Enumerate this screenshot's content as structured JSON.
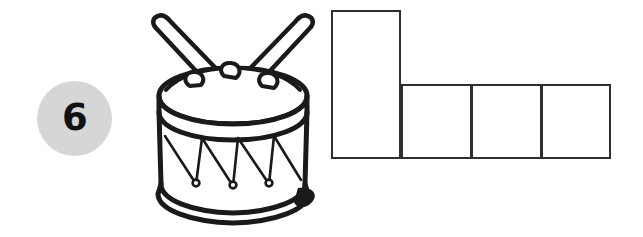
{
  "page": {
    "background_color": "#ffffff",
    "width": 643,
    "height": 237
  },
  "item": {
    "number": "6",
    "badge_fill": "#d6d6d6",
    "badge_text_color": "#111111"
  },
  "illustration": {
    "name": "drum-with-drumsticks",
    "alt_text": "Line drawing of a marching drum with two crossed drumsticks",
    "line_color": "#1a1a1a",
    "fill_color": "#ffffff",
    "parts": [
      "left-drumstick",
      "right-drumstick",
      "drum-head",
      "top-rim",
      "drum-shell",
      "tension-cords",
      "bottom-rim",
      "shadow"
    ]
  },
  "answer_grid": {
    "name": "l-shaped-answer-boxes",
    "stroke_color": "#2f2f2f",
    "fill_color": "#ffffff",
    "stroke_width": 2,
    "cell_count": 4,
    "cells": [
      {
        "label": "",
        "x": 0,
        "y": 0,
        "width": 70,
        "height": 149
      },
      {
        "label": "",
        "x": 70,
        "y": 74,
        "width": 71,
        "height": 75
      },
      {
        "label": "",
        "x": 140,
        "y": 74,
        "width": 71,
        "height": 75
      },
      {
        "label": "",
        "x": 210,
        "y": 74,
        "width": 70,
        "height": 75
      }
    ]
  }
}
